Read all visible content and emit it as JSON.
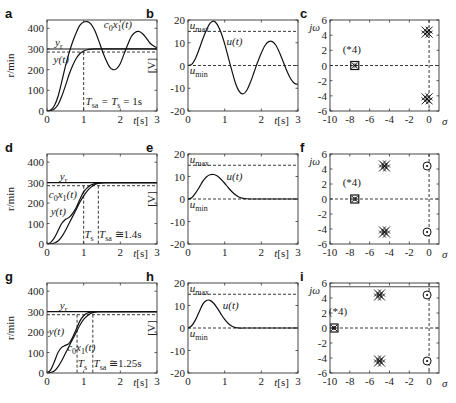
{
  "figure": {
    "panels": [
      "a",
      "b",
      "c",
      "d",
      "e",
      "f",
      "g",
      "h",
      "i"
    ]
  },
  "chart_data": [
    {
      "id": "a",
      "type": "line",
      "letter": "a",
      "xlabel": "t[s]",
      "ylabel": "r/min",
      "xlim": [
        0,
        3
      ],
      "ylim": [
        0,
        440
      ],
      "xticks": [
        0,
        1,
        2,
        3
      ],
      "yticks": [
        0,
        100,
        200,
        300,
        400
      ],
      "box": [
        47,
        20,
        157,
        111
      ],
      "series": [
        {
          "name": "c0x1(t)",
          "x": [
            0,
            0.1,
            0.2,
            0.3,
            0.4,
            0.5,
            0.6,
            0.7,
            0.8,
            0.9,
            1.0,
            1.1,
            1.2,
            1.3,
            1.4,
            1.5,
            1.6,
            1.7,
            1.8,
            1.9,
            2.0,
            2.1,
            2.2,
            2.3,
            2.4,
            2.5,
            2.6,
            2.7,
            2.8,
            2.9,
            3.0
          ],
          "y": [
            0,
            5,
            25,
            70,
            140,
            215,
            280,
            335,
            380,
            415,
            430,
            432,
            420,
            390,
            345,
            295,
            250,
            215,
            200,
            205,
            230,
            275,
            320,
            360,
            380,
            385,
            375,
            355,
            330,
            315,
            305
          ]
        },
        {
          "name": "y(t)",
          "x": [
            0,
            0.1,
            0.2,
            0.3,
            0.4,
            0.5,
            0.6,
            0.7,
            0.8,
            0.9,
            1.0,
            1.1,
            1.2,
            1.3,
            1.4,
            1.5,
            1.6,
            1.8,
            2.0,
            2.5,
            3.0
          ],
          "y": [
            0,
            2,
            10,
            30,
            70,
            120,
            175,
            220,
            255,
            278,
            290,
            296,
            299,
            300,
            300,
            300,
            300,
            300,
            300,
            300,
            300
          ]
        }
      ],
      "references": [
        {
          "name": "yr",
          "y": 300,
          "style": "solid"
        },
        {
          "name": "95% band",
          "y": 285,
          "style": "dashed"
        }
      ],
      "vlines": [
        {
          "x": 1.0,
          "y_to": 285
        }
      ],
      "labels": [
        {
          "text": "c0x1(t)",
          "x": 1.55,
          "y": 400
        },
        {
          "text": "yr",
          "x": 0.22,
          "y": 312
        },
        {
          "text": "y(t)",
          "x": 0.18,
          "y": 230
        },
        {
          "text": "Tsa = Ts = 1s",
          "x": 1.05,
          "y": 30
        }
      ],
      "annotation": "T_sa = T_s = 1s"
    },
    {
      "id": "b",
      "type": "line",
      "letter": "b",
      "xlabel": "t[s]",
      "ylabel": "[V]",
      "xlim": [
        0,
        3
      ],
      "ylim": [
        -20,
        20
      ],
      "xticks": [
        0,
        1,
        2,
        3
      ],
      "yticks": [
        -20,
        -10,
        0,
        10,
        20
      ],
      "box": [
        188,
        20,
        298,
        111
      ],
      "series": [
        {
          "name": "u(t)",
          "x": [
            0,
            0.1,
            0.2,
            0.3,
            0.4,
            0.5,
            0.6,
            0.7,
            0.8,
            0.9,
            1.0,
            1.1,
            1.2,
            1.3,
            1.4,
            1.5,
            1.6,
            1.7,
            1.8,
            1.9,
            2.0,
            2.1,
            2.2,
            2.3,
            2.4,
            2.5,
            2.6,
            2.7,
            2.8,
            2.9,
            3.0
          ],
          "y": [
            0,
            0.5,
            3,
            7,
            11.5,
            15.5,
            18.5,
            19.5,
            18,
            14.5,
            9.5,
            3.5,
            -2.5,
            -8,
            -11.5,
            -12.5,
            -11,
            -7.5,
            -3,
            1.5,
            5.5,
            8.8,
            10.5,
            10.5,
            8.8,
            5.5,
            1.5,
            -2.5,
            -5.8,
            -7.8,
            -8.3
          ]
        }
      ],
      "references": [
        {
          "name": "umax",
          "y": 15,
          "style": "dashed"
        },
        {
          "name": "umin",
          "y": 0,
          "style": "dashed"
        }
      ],
      "labels": [
        {
          "text": "umax",
          "x": 0.05,
          "y": 16.2
        },
        {
          "text": "umin",
          "x": 0.05,
          "y": -3.8
        },
        {
          "text": "u(t)",
          "x": 1.05,
          "y": 9
        }
      ]
    },
    {
      "id": "c",
      "type": "scatter",
      "letter": "c",
      "xlabel": "σ",
      "ylabel": "jω",
      "xlim": [
        -10,
        1
      ],
      "ylim": [
        -6,
        6
      ],
      "xticks": [
        -10,
        -8,
        -6,
        -4,
        -2,
        0
      ],
      "yticks": [
        -6,
        -4,
        -2,
        0,
        2,
        4,
        6
      ],
      "box": [
        330,
        20,
        439,
        111
      ],
      "points": [
        {
          "x": -7.5,
          "y": 0,
          "marker": "boxed-x",
          "note": "(*4)"
        },
        {
          "x": -0.2,
          "y": 4.4,
          "marker": "cluster-x"
        },
        {
          "x": -0.2,
          "y": -4.4,
          "marker": "cluster-x"
        }
      ],
      "annotation": "(*4)",
      "annotation_pos": [
        -7.8,
        1.7
      ]
    },
    {
      "id": "d",
      "type": "line",
      "letter": "d",
      "xlabel": "t[s]",
      "ylabel": "r/min",
      "xlim": [
        0,
        3
      ],
      "ylim": [
        0,
        440
      ],
      "xticks": [
        0,
        1,
        2,
        3
      ],
      "yticks": [
        0,
        100,
        200,
        300,
        400
      ],
      "box": [
        47,
        154,
        157,
        244
      ],
      "series": [
        {
          "name": "c0x1(t)",
          "x": [
            0,
            0.1,
            0.2,
            0.3,
            0.4,
            0.5,
            0.6,
            0.7,
            0.8,
            0.9,
            1.0,
            1.1,
            1.2,
            1.3,
            1.4,
            1.5,
            1.6,
            1.8,
            2.0,
            3.0
          ],
          "y": [
            0,
            8,
            30,
            65,
            100,
            120,
            130,
            150,
            180,
            220,
            255,
            275,
            288,
            295,
            298,
            300,
            300,
            300,
            300,
            300
          ]
        },
        {
          "name": "y(t)",
          "x": [
            0,
            0.1,
            0.2,
            0.3,
            0.4,
            0.5,
            0.6,
            0.7,
            0.8,
            0.9,
            1.0,
            1.1,
            1.2,
            1.3,
            1.4,
            1.5,
            1.6,
            1.8,
            2.0,
            3.0
          ],
          "y": [
            0,
            1,
            5,
            15,
            35,
            65,
            100,
            135,
            170,
            205,
            235,
            260,
            278,
            290,
            296,
            299,
            300,
            300,
            300,
            300
          ]
        }
      ],
      "references": [
        {
          "name": "yr",
          "y": 300,
          "style": "solid"
        },
        {
          "name": "95% band",
          "y": 285,
          "style": "dashed"
        }
      ],
      "vlines": [
        {
          "x": 1.0,
          "y_to": 285
        },
        {
          "x": 1.4,
          "y_to": 285
        }
      ],
      "labels": [
        {
          "text": "yr",
          "x": 0.35,
          "y": 312
        },
        {
          "text": "c0x1(t)",
          "x": 0.05,
          "y": 225
        },
        {
          "text": "y(t)",
          "x": 0.1,
          "y": 140
        },
        {
          "text": "Ts",
          "x": 1.02,
          "y": 30
        },
        {
          "text": "Tsa ≅1.4s",
          "x": 1.42,
          "y": 30
        }
      ],
      "annotation": "T_s, T_sa ≅ 1.4s"
    },
    {
      "id": "e",
      "type": "line",
      "letter": "e",
      "xlabel": "t[s]",
      "ylabel": "[V]",
      "xlim": [
        0,
        3
      ],
      "ylim": [
        -20,
        20
      ],
      "xticks": [
        0,
        1,
        2,
        3
      ],
      "yticks": [
        -20,
        -10,
        0,
        10,
        20
      ],
      "box": [
        188,
        154,
        298,
        244
      ],
      "series": [
        {
          "name": "u(t)",
          "x": [
            0,
            0.1,
            0.2,
            0.3,
            0.4,
            0.5,
            0.6,
            0.7,
            0.8,
            0.9,
            1.0,
            1.1,
            1.2,
            1.3,
            1.4,
            1.5,
            1.6,
            1.8,
            2.0,
            3.0
          ],
          "y": [
            0,
            0.6,
            2.5,
            5,
            7.8,
            9.8,
            10.8,
            10.9,
            10.2,
            8.8,
            7,
            5,
            3.2,
            1.8,
            0.8,
            0.3,
            0.1,
            0,
            0,
            0
          ]
        }
      ],
      "references": [
        {
          "name": "umax",
          "y": 15,
          "style": "dashed"
        },
        {
          "name": "umin",
          "y": 0,
          "style": "dashed"
        }
      ],
      "labels": [
        {
          "text": "umax",
          "x": 0.05,
          "y": 16.2
        },
        {
          "text": "umin",
          "x": 0.05,
          "y": -3.8
        },
        {
          "text": "u(t)",
          "x": 1.05,
          "y": 8.5
        }
      ]
    },
    {
      "id": "f",
      "type": "scatter",
      "letter": "f",
      "xlabel": "σ",
      "ylabel": "jω",
      "xlim": [
        -10,
        1
      ],
      "ylim": [
        -6,
        6
      ],
      "xticks": [
        -10,
        -8,
        -6,
        -4,
        -2,
        0
      ],
      "yticks": [
        -6,
        -4,
        -2,
        0,
        2,
        4,
        6
      ],
      "box": [
        330,
        154,
        439,
        244
      ],
      "points": [
        {
          "x": -7.5,
          "y": 0,
          "marker": "boxed-x",
          "note": "(*4)"
        },
        {
          "x": -4.5,
          "y": 4.4,
          "marker": "cluster-x"
        },
        {
          "x": -4.5,
          "y": -4.4,
          "marker": "cluster-x"
        },
        {
          "x": -0.2,
          "y": 4.4,
          "marker": "circle-dot"
        },
        {
          "x": -0.2,
          "y": -4.4,
          "marker": "circle-dot"
        }
      ],
      "annotation": "(*4)",
      "annotation_pos": [
        -7.8,
        1.7
      ]
    },
    {
      "id": "g",
      "type": "line",
      "letter": "g",
      "xlabel": "t[s]",
      "ylabel": "r/min",
      "xlim": [
        0,
        3
      ],
      "ylim": [
        0,
        440
      ],
      "xticks": [
        0,
        1,
        2,
        3
      ],
      "yticks": [
        0,
        100,
        200,
        300,
        400
      ],
      "box": [
        47,
        283,
        157,
        373
      ],
      "series": [
        {
          "name": "y(t)",
          "x": [
            0,
            0.1,
            0.2,
            0.3,
            0.4,
            0.5,
            0.6,
            0.7,
            0.8,
            0.9,
            1.0,
            1.1,
            1.2,
            1.3,
            1.4,
            1.6,
            2.0,
            3.0
          ],
          "y": [
            0,
            15,
            55,
            100,
            125,
            135,
            145,
            175,
            215,
            255,
            280,
            293,
            298,
            300,
            300,
            300,
            300,
            300
          ]
        },
        {
          "name": "c0x1(t)",
          "x": [
            0,
            0.1,
            0.2,
            0.3,
            0.4,
            0.5,
            0.6,
            0.7,
            0.8,
            0.9,
            1.0,
            1.1,
            1.2,
            1.3,
            1.4,
            1.6,
            2.0,
            3.0
          ],
          "y": [
            0,
            2,
            10,
            30,
            60,
            95,
            130,
            165,
            200,
            235,
            262,
            280,
            292,
            297,
            300,
            300,
            300,
            300
          ]
        }
      ],
      "references": [
        {
          "name": "yr",
          "y": 300,
          "style": "solid"
        },
        {
          "name": "95% band",
          "y": 285,
          "style": "dashed"
        }
      ],
      "vlines": [
        {
          "x": 0.82,
          "y_to": 285
        },
        {
          "x": 1.25,
          "y_to": 285
        }
      ],
      "labels": [
        {
          "text": "yr",
          "x": 0.35,
          "y": 312
        },
        {
          "text": "y(t)",
          "x": 0.05,
          "y": 185
        },
        {
          "text": "c0x1(t)",
          "x": 0.55,
          "y": 110
        },
        {
          "text": "Ts",
          "x": 0.84,
          "y": 30
        },
        {
          "text": "Tsa ≅1.25s",
          "x": 1.27,
          "y": 30
        }
      ],
      "annotation": "T_s, T_sa ≅ 1.25s"
    },
    {
      "id": "h",
      "type": "line",
      "letter": "h",
      "xlabel": "t[s]",
      "ylabel": "[V]",
      "xlim": [
        0,
        3
      ],
      "ylim": [
        -20,
        20
      ],
      "xticks": [
        0,
        1,
        2,
        3
      ],
      "yticks": [
        -20,
        -10,
        0,
        10,
        20
      ],
      "box": [
        188,
        283,
        298,
        373
      ],
      "series": [
        {
          "name": "u(t)",
          "x": [
            0,
            0.1,
            0.2,
            0.3,
            0.4,
            0.5,
            0.6,
            0.7,
            0.8,
            0.9,
            1.0,
            1.1,
            1.2,
            1.3,
            1.4,
            1.6,
            2.0,
            3.0
          ],
          "y": [
            0,
            1,
            3.5,
            7,
            10.5,
            12.2,
            12.3,
            11,
            8.8,
            6.2,
            3.8,
            2,
            0.8,
            0.2,
            0,
            0,
            0,
            0
          ]
        }
      ],
      "references": [
        {
          "name": "umax",
          "y": 15,
          "style": "dashed"
        },
        {
          "name": "umin",
          "y": 0,
          "style": "dashed"
        }
      ],
      "labels": [
        {
          "text": "umax",
          "x": 0.05,
          "y": 16.2
        },
        {
          "text": "umin",
          "x": 0.05,
          "y": -3.8
        },
        {
          "text": "u(t)",
          "x": 0.95,
          "y": 8.5
        }
      ]
    },
    {
      "id": "i",
      "type": "scatter",
      "letter": "i",
      "xlabel": "σ",
      "ylabel": "jω",
      "xlim": [
        -10,
        1
      ],
      "ylim": [
        -6,
        6
      ],
      "xticks": [
        -10,
        -8,
        -6,
        -4,
        -2,
        0
      ],
      "yticks": [
        -6,
        -4,
        -2,
        0,
        2,
        4,
        6
      ],
      "box": [
        330,
        283,
        439,
        373
      ],
      "points": [
        {
          "x": -9.6,
          "y": 0,
          "marker": "boxed-x",
          "note": "(*4)"
        },
        {
          "x": -5.0,
          "y": 4.4,
          "marker": "cluster-x"
        },
        {
          "x": -5.0,
          "y": -4.4,
          "marker": "cluster-x"
        },
        {
          "x": -0.2,
          "y": 4.4,
          "marker": "circle-dot"
        },
        {
          "x": -0.2,
          "y": -4.4,
          "marker": "circle-dot"
        }
      ],
      "hline_top": 5.5,
      "annotation": "(*4)",
      "annotation_pos": [
        -9.2,
        1.7
      ]
    }
  ]
}
